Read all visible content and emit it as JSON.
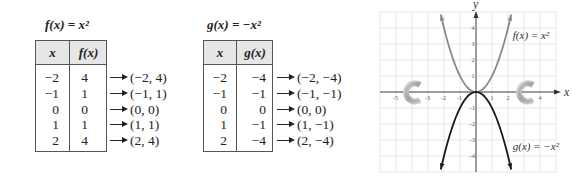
{
  "tables": [
    {
      "title": "f(x) = x²",
      "headers": [
        "x",
        "f(x)"
      ],
      "rows": [
        {
          "x": "−2",
          "y": "4",
          "pair": "(−2, 4)"
        },
        {
          "x": "−1",
          "y": "1",
          "pair": "(−1, 1)"
        },
        {
          "x": "0",
          "y": "0",
          "pair": "(0, 0)"
        },
        {
          "x": "1",
          "y": "1",
          "pair": "(1, 1)"
        },
        {
          "x": "2",
          "y": "4",
          "pair": "(2, 4)"
        }
      ]
    },
    {
      "title": "g(x) = −x²",
      "headers": [
        "x",
        "g(x)"
      ],
      "rows": [
        {
          "x": "−2",
          "y": "−4",
          "pair": "(−2, −4)"
        },
        {
          "x": "−1",
          "y": "−1",
          "pair": "(−1, −1)"
        },
        {
          "x": "0",
          "y": "0",
          "pair": "(0, 0)"
        },
        {
          "x": "1",
          "y": "−1",
          "pair": "(1, −1)"
        },
        {
          "x": "2",
          "y": "−4",
          "pair": "(2, −4)"
        }
      ]
    }
  ],
  "chart_data": {
    "type": "line",
    "title": "",
    "xlabel": "x",
    "ylabel": "y",
    "xlim": [
      -6,
      5
    ],
    "ylim": [
      -5,
      5
    ],
    "grid": true,
    "x_ticks": [
      -5,
      -3,
      -2,
      -1,
      1,
      2,
      4
    ],
    "y_ticks": [
      4,
      3,
      2,
      1,
      -1,
      -2,
      -3,
      -4
    ],
    "series": [
      {
        "name": "f(x) = x²",
        "label": "f(x) = x²",
        "color": "#8a8a8a",
        "x_range": [
          -2.2,
          2.2
        ],
        "points": [
          [
            -2,
            4
          ],
          [
            -1,
            1
          ],
          [
            0,
            0
          ],
          [
            1,
            1
          ],
          [
            2,
            4
          ]
        ],
        "label_pos": [
          2.3,
          3.3
        ]
      },
      {
        "name": "g(x) = −x²",
        "label": "g(x) = −x²",
        "color": "#1a1a1a",
        "x_range": [
          -2.2,
          2.2
        ],
        "points": [
          [
            -2,
            -4
          ],
          [
            -1,
            -1
          ],
          [
            0,
            0
          ],
          [
            1,
            -1
          ],
          [
            2,
            -4
          ]
        ],
        "label_pos": [
          2.3,
          -3.6
        ]
      }
    ],
    "colors": {
      "grid": "#dcdcdc",
      "axis": "#333333"
    }
  }
}
